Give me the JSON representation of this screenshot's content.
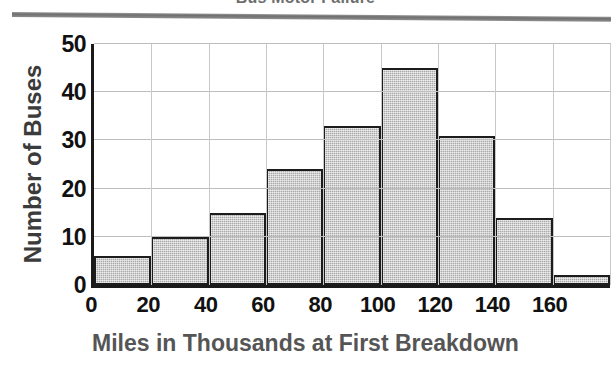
{
  "figure": {
    "title": "Bus Motor Failure",
    "title_note": "clipped at top edge of image"
  },
  "chart_data": {
    "type": "bar",
    "title": "Bus Motor Failure",
    "xlabel": "Miles in Thousands at First Breakdown",
    "ylabel": "Number of Buses",
    "categories": [
      "0-20",
      "20-40",
      "40-60",
      "60-80",
      "80-100",
      "100-120",
      "120-140",
      "140-160",
      "160-180"
    ],
    "bin_edges": [
      0,
      20,
      40,
      60,
      80,
      100,
      120,
      140,
      160,
      180
    ],
    "values": [
      6,
      10,
      15,
      24,
      33,
      45,
      31,
      14,
      2
    ],
    "x": [
      0,
      20,
      40,
      60,
      80,
      100,
      120,
      140,
      160
    ],
    "xlim": [
      0,
      180
    ],
    "ylim": [
      0,
      50
    ],
    "xticks": [
      "0",
      "20",
      "40",
      "60",
      "80",
      "100",
      "120",
      "140",
      "160"
    ],
    "xtick_values": [
      0,
      20,
      40,
      60,
      80,
      100,
      120,
      140,
      160
    ],
    "yticks": [
      "0",
      "10",
      "20",
      "30",
      "40",
      "50"
    ],
    "ytick_values": [
      0,
      10,
      20,
      30,
      40,
      50
    ],
    "grid": true,
    "legend": null,
    "bar_fill_color": "#a9a9a9",
    "bar_edge_color": "#1c1c1c",
    "axis_color": "#1a1a1a",
    "grid_color": "#bdbdbd",
    "label_color": "#555555"
  }
}
